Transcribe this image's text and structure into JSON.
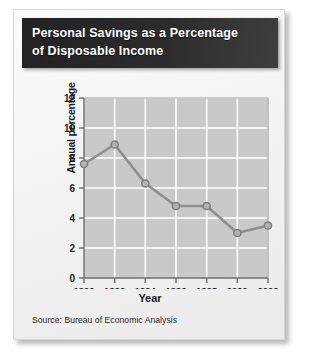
{
  "card": {
    "title": "Personal Savings as a Percentage\nof Disposable Income",
    "source": "Source: Bureau of Economic Analysis"
  },
  "colors": {
    "title_bar": "#2c2c2c",
    "title_text": "#ffffff",
    "plot_background": "#c9c9c9",
    "gridline": "#ffffff",
    "series_line": "#8e8e8e",
    "marker_fill": "#b2b2b2",
    "marker_stroke": "#7d7d7d",
    "axis": "#6e6e6e",
    "card_background": "#f4f3f2"
  },
  "chart_data": {
    "type": "line",
    "title": "Personal Savings as a Percentage of Disposable Income",
    "xlabel": "Year",
    "ylabel": "Annual percentage",
    "x": [
      1990,
      1992,
      1994,
      1996,
      1998,
      2000,
      2002
    ],
    "values": [
      7.6,
      8.9,
      6.3,
      4.8,
      4.8,
      3.0,
      3.5
    ],
    "series": [
      {
        "name": "Personal savings rate",
        "values": [
          7.6,
          8.9,
          6.3,
          4.8,
          4.8,
          3.0,
          3.5
        ]
      }
    ],
    "xtick_labels": [
      "1990",
      "1992",
      "1994",
      "1996",
      "1998",
      "2000",
      "2002"
    ],
    "ytick_labels": [
      "0",
      "2",
      "4",
      "6",
      "8",
      "10",
      "12"
    ],
    "yticks": [
      0,
      2,
      4,
      6,
      8,
      10,
      12
    ],
    "xlim": [
      1990,
      2002
    ],
    "ylim": [
      0,
      12
    ],
    "grid": true,
    "legend": false,
    "source": "Source: Bureau of Economic Analysis"
  }
}
